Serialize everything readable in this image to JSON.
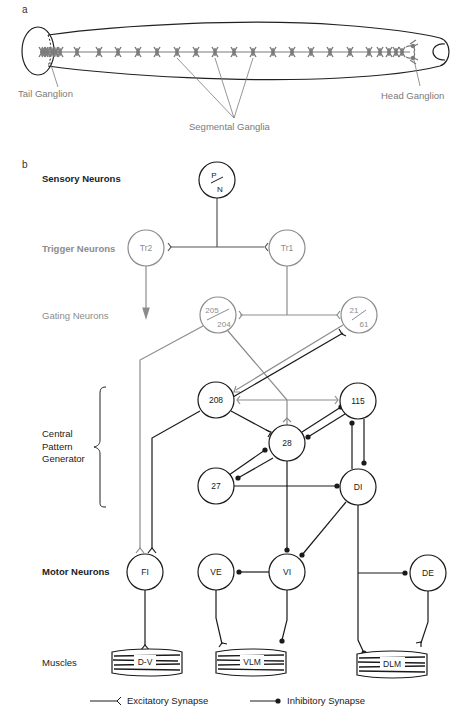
{
  "panel_a": {
    "label": "a",
    "tail_label": "Tail Ganglion",
    "head_label": "Head Ganglion",
    "segmental_label": "Segmental Ganglia"
  },
  "panel_b": {
    "label": "b",
    "rows": {
      "sensory": "Sensory Neurons",
      "trigger": "Trigger Neurons",
      "gating": "Gating Neurons",
      "cpg_line1": "Central",
      "cpg_line2": "Pattern",
      "cpg_line3": "Generator",
      "motor": "Motor Neurons",
      "muscles": "Muscles"
    },
    "neurons": {
      "pn_top": "P",
      "pn_bottom": "N",
      "tr2": "Tr2",
      "tr1": "Tr1",
      "g205": "205",
      "g204": "204",
      "g21": "21",
      "g61": "61",
      "n208": "208",
      "n115": "115",
      "n28": "28",
      "n27": "27",
      "di": "DI",
      "fi": "FI",
      "ve": "VE",
      "vi": "VI",
      "de": "DE"
    },
    "muscles": {
      "dv": "D-V",
      "vlm": "VLM",
      "dlm": "DLM"
    },
    "legend": {
      "excitatory": "Excitatory Synapse",
      "inhibitory": "Inhibitory Synapse"
    }
  },
  "colors": {
    "black": "#1a1a1a",
    "grey": "#8c8c8c",
    "ganglion": "#7a7a7a"
  }
}
